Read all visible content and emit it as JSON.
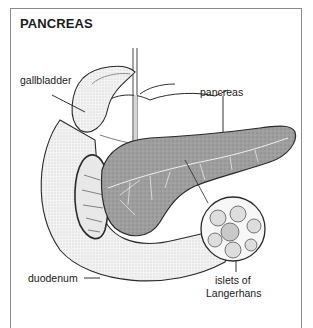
{
  "diagram": {
    "title": "PANCREAS",
    "labels": {
      "gallbladder": "gallbladder",
      "pancreas": "pancreas",
      "duodenum": "duodenum",
      "islets_line1": "islets of",
      "islets_line2": "Langerhans"
    },
    "colors": {
      "border": "#8a8a8a",
      "pancreas_fill": "#9a9a9a",
      "duodenum_fill": "#efefef",
      "outline": "#2a2a2a",
      "text": "#1a1a1a"
    }
  }
}
